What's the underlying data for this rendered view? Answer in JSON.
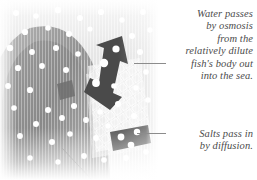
{
  "figure": {
    "palette": {
      "background": "#ffffff",
      "text": "#4c4c4c",
      "leader_line": "#8c8c8c",
      "arrow_dark": "#4a4a4a",
      "salt_block_dark": "#5a5a5a",
      "body_mid_gray": "#9a9a9a",
      "body_dark_gray": "#848484",
      "water_light": "#e8e8e8",
      "particle_white": "#ffffff",
      "gill_mesh": "#f2f2f2"
    }
  },
  "illustration": {
    "name": "fish-gill-cross-section",
    "elements": {
      "water_particles_label": "water-molecule-dots",
      "fish_body_label": "fish-body-arch",
      "gill_mesh_label": "gill-lattice-mesh",
      "outflow_arrow_label": "water-outflow-arrow",
      "salt_block_label": "salt-ion-block",
      "bottom_leader_label": "body-surface-leader-line"
    }
  },
  "captions": [
    {
      "name": "osmosis-caption",
      "lines": [
        "Water passes",
        "by osmosis",
        "from the",
        "relatively dilute",
        "fish's body out",
        "into the sea."
      ]
    },
    {
      "name": "salts-caption",
      "lines": [
        "Salts pass in",
        "by diffusion."
      ]
    }
  ],
  "leaders": [
    {
      "name": "osmosis-leader-line"
    },
    {
      "name": "salts-leader-line"
    }
  ]
}
